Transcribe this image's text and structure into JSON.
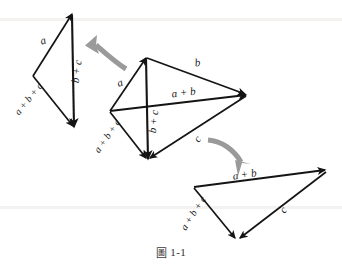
{
  "figure": {
    "caption": {
      "glyph": "圖",
      "glyph_name": "figure-cjk-character",
      "number": "1-1",
      "full_text": "圖 1-1"
    },
    "background_color": "#ffffff",
    "stroke_color": "#141414",
    "arrow_hint_color": "#9a9a9a",
    "panels": [
      {
        "id": "left-triangle",
        "name": "left-vector-triangle",
        "description": "triangle showing a + (b + c)",
        "vertices": {
          "apex": [
            72,
            14
          ],
          "left": [
            33,
            76
          ],
          "bottom": [
            74,
            127
          ]
        },
        "edges": [
          {
            "label": "a",
            "from": "left",
            "to": "apex",
            "label_pos": [
              44,
              44
            ],
            "rotation": -18
          },
          {
            "label": "b + c",
            "from": "apex",
            "to": "bottom",
            "label_pos": [
              80,
              72
            ],
            "rotation": -82
          },
          {
            "label": "a + b + c",
            "from": "left",
            "to": "bottom",
            "label_pos": [
              31,
              100
            ],
            "rotation": -51
          }
        ]
      },
      {
        "id": "middle-figure",
        "name": "middle-vector-quadrilateral",
        "description": "central construction with both diagonals a + b and b + c",
        "vertices": {
          "top": [
            146,
            57
          ],
          "left": [
            110,
            111
          ],
          "right": [
            246,
            95
          ],
          "bottom": [
            148,
            159
          ]
        },
        "edges": [
          {
            "label": "a",
            "from": "left",
            "to": "top",
            "label_pos": [
              121,
              85
            ],
            "rotation": -20
          },
          {
            "label": "b",
            "from": "top",
            "to": "right",
            "label_pos": [
              198,
              67
            ],
            "rotation": -8
          },
          {
            "label": "a + b",
            "from": "left",
            "to": "right",
            "label_pos": [
              182,
              96
            ],
            "rotation": -7
          },
          {
            "label": "b + c",
            "from": "top",
            "to": "bottom",
            "label_pos": [
              156,
              122
            ],
            "rotation": -84
          },
          {
            "label": "c",
            "from": "right",
            "to": "bottom",
            "label_pos": [
              199,
              140
            ],
            "rotation": -50
          },
          {
            "label": "a + b + c",
            "from": "left",
            "to": "bottom",
            "label_pos": [
              110,
              136
            ],
            "rotation": -55
          }
        ]
      },
      {
        "id": "right-triangle",
        "name": "right-vector-triangle",
        "description": "triangle showing (a + b) + c",
        "vertices": {
          "left": [
            194,
            187
          ],
          "right": [
            326,
            170
          ],
          "bottom": [
            237,
            239
          ]
        },
        "edges": [
          {
            "label": "a + b",
            "from": "left",
            "to": "right",
            "label_pos": [
              243,
              179
            ],
            "rotation": -8
          },
          {
            "label": "c",
            "from": "right",
            "to": "bottom",
            "label_pos": [
              285,
              211
            ],
            "rotation": -52
          },
          {
            "label": "a + b + c",
            "from": "left",
            "to": "bottom",
            "label_pos": [
              196,
              213
            ],
            "rotation": -57
          }
        ]
      }
    ],
    "hint_arrows": [
      {
        "id": "arrow-left",
        "name": "curved-arrow-to-left-triangle",
        "direction": "up-left",
        "from": [
          126,
          68
        ],
        "to": [
          89,
          43
        ]
      },
      {
        "id": "arrow-right",
        "name": "curved-arrow-to-right-triangle",
        "direction": "down-right",
        "from": [
          208,
          139
        ],
        "to": [
          246,
          172
        ]
      }
    ]
  }
}
